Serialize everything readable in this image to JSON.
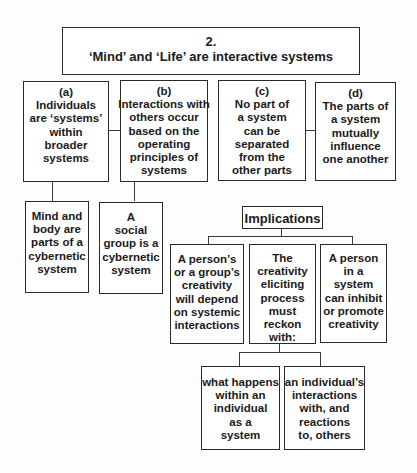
{
  "diagram": {
    "title": {
      "number": "2.",
      "text": "‘Mind’ and ‘Life’ are interactive systems"
    },
    "principles": [
      {
        "id": "a",
        "label": "(a)",
        "lines": [
          "Individuals",
          "are ‘systems’",
          "within",
          "broader",
          "systems"
        ]
      },
      {
        "id": "b",
        "label": "(b)",
        "lines": [
          "Interactions with",
          "others occur",
          "based on the",
          "operating",
          "principles of",
          "systems"
        ]
      },
      {
        "id": "c",
        "label": "(c)",
        "lines": [
          "No part of",
          "a system",
          "can be",
          "separated",
          "from the",
          "other parts"
        ]
      },
      {
        "id": "d",
        "label": "(d)",
        "lines": [
          "The parts of",
          "a system",
          "mutually",
          "influence",
          "one another"
        ]
      }
    ],
    "sub_principles": [
      {
        "parent": "a",
        "lines": [
          "Mind and",
          "body are",
          "parts of a",
          "cybernetic",
          "system"
        ]
      },
      {
        "parent": "b",
        "lines": [
          "A",
          "social",
          "group is a",
          "cybernetic",
          "system"
        ]
      }
    ],
    "implications": {
      "heading": "Implications",
      "items": [
        {
          "lines": [
            "A person’s",
            "or a group’s",
            "creativity",
            "will depend",
            "on systemic",
            "interactions"
          ]
        },
        {
          "lines": [
            "The",
            "creativity",
            "eliciting",
            "process",
            "must",
            "reckon",
            "with:"
          ]
        },
        {
          "lines": [
            "A person",
            "in a",
            "system",
            "can inhibit",
            "or promote",
            "creativity"
          ]
        }
      ],
      "reckon_with": [
        {
          "lines": [
            "what happens",
            "within an",
            "individual",
            "as a",
            "system"
          ]
        },
        {
          "lines": [
            "an individual’s",
            "interactions",
            "with, and",
            "reactions",
            "to, others"
          ]
        }
      ]
    }
  }
}
